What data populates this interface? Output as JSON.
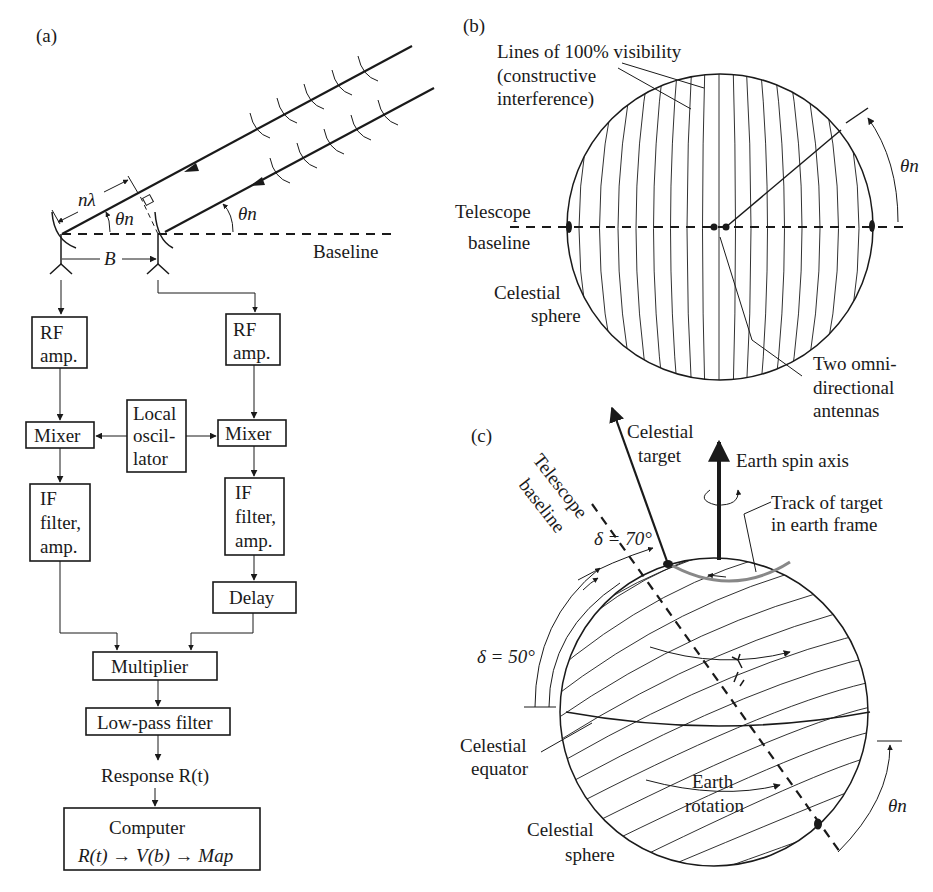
{
  "figure": {
    "panels": {
      "a": {
        "label": "(a)",
        "wave_labels": {
          "path_difference": "nλ",
          "angle": "θn",
          "baseline_vector": "B",
          "baseline": "Baseline"
        },
        "blocks": {
          "rf_amp_left": [
            "RF",
            "amp."
          ],
          "rf_amp_right": [
            "RF",
            "amp."
          ],
          "mixer_left": "Mixer",
          "mixer_right": "Mixer",
          "local_oscillator": [
            "Local",
            "oscil-",
            "lator"
          ],
          "if_filter_left": [
            "IF",
            "filter,",
            "amp."
          ],
          "if_filter_right": [
            "IF",
            "filter,",
            "amp."
          ],
          "delay": "Delay",
          "multiplier": "Multiplier",
          "low_pass_filter": "Low-pass filter",
          "response": "Response R(t)",
          "computer_title": "Computer",
          "computer_formula": "R(t) → V(b) → Map"
        }
      },
      "b": {
        "label": "(b)",
        "annotations": {
          "fringes": [
            "Lines of 100% visibility",
            "(constructive",
            "interference)"
          ],
          "telescope_baseline": [
            "Telescope",
            "baseline"
          ],
          "celestial_sphere": [
            "Celestial",
            "sphere"
          ],
          "antennas": [
            "Two omni-",
            "directional",
            "antennas"
          ],
          "angle": "θn"
        }
      },
      "c": {
        "label": "(c)",
        "annotations": {
          "celestial_target": [
            "Celestial",
            "target"
          ],
          "earth_spin_axis": "Earth spin axis",
          "telescope_baseline": [
            "Telescope",
            "baseline"
          ],
          "track": [
            "Track of target",
            "in earth frame"
          ],
          "delta_70": "δ = 70°",
          "delta_50": "δ = 50°",
          "celestial_equator": [
            "Celestial",
            "equator"
          ],
          "earth_rotation": [
            "Earth",
            "rotation"
          ],
          "celestial_sphere": [
            "Celestial",
            "sphere"
          ],
          "angle": "θn"
        }
      }
    }
  }
}
